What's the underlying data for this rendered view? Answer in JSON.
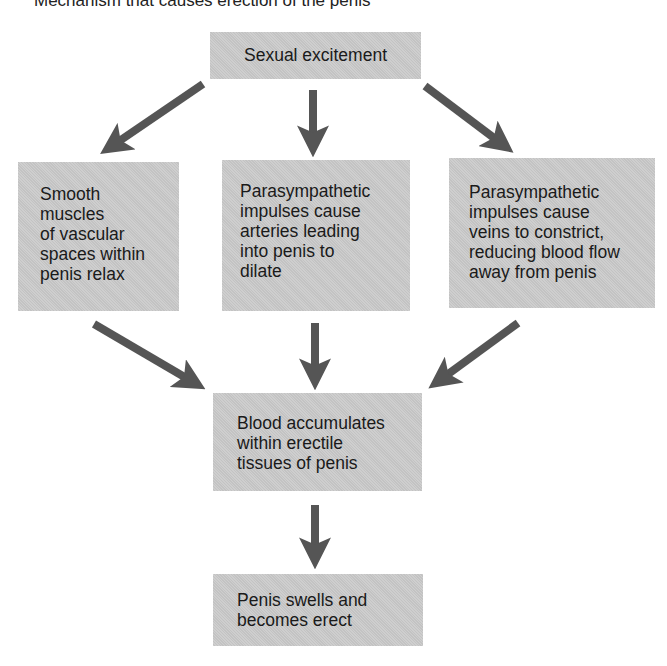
{
  "title": "Mechanism that causes erection of the penis",
  "colors": {
    "box_fill": "#c9c9c9",
    "arrow": "#555555",
    "text": "#1a1a1a",
    "background": "#ffffff"
  },
  "nodes": {
    "trigger": {
      "lines": [
        "Sexual excitement"
      ]
    },
    "smooth_muscles": {
      "lines": [
        "Smooth",
        "muscles",
        "of vascular",
        "spaces within",
        "penis relax"
      ]
    },
    "arteries_dilate": {
      "lines": [
        "Parasympathetic",
        "impulses cause",
        "arteries leading",
        "into penis to",
        "dilate"
      ]
    },
    "veins_constrict": {
      "lines": [
        "Parasympathetic",
        "impulses cause",
        "veins to constrict,",
        "reducing blood flow",
        "away from penis"
      ]
    },
    "blood_accumulates": {
      "lines": [
        "Blood accumulates",
        "within erectile",
        "tissues of penis"
      ]
    },
    "result": {
      "lines": [
        "Penis swells and",
        "becomes erect"
      ]
    }
  },
  "edges": [
    {
      "from": "trigger",
      "to": "smooth_muscles"
    },
    {
      "from": "trigger",
      "to": "arteries_dilate"
    },
    {
      "from": "trigger",
      "to": "veins_constrict"
    },
    {
      "from": "smooth_muscles",
      "to": "blood_accumulates"
    },
    {
      "from": "arteries_dilate",
      "to": "blood_accumulates"
    },
    {
      "from": "veins_constrict",
      "to": "blood_accumulates"
    },
    {
      "from": "blood_accumulates",
      "to": "result"
    }
  ]
}
